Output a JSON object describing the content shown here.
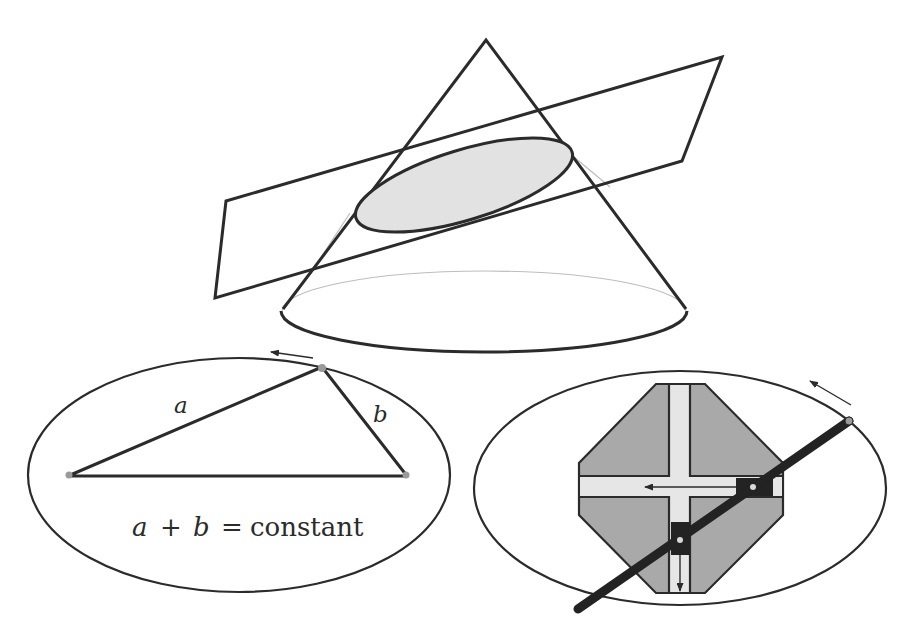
{
  "figure": {
    "colors": {
      "stroke": "#2b2b2b",
      "faint_line": "#b8b8b8",
      "section_fill": "#e2e2e2",
      "trammel_body": "#a9a9a9",
      "slot_fill": "#e6e6e6",
      "rod": "#232323",
      "focus_dot": "#9a9a9a"
    }
  },
  "cone_panel": {
    "apex": [
      486,
      40
    ],
    "base_ellipse": {
      "cx": 484,
      "cy": 311,
      "rx": 204,
      "ry": 41
    },
    "cutting_plane": [
      [
        226,
        201
      ],
      [
        722,
        57
      ],
      [
        682,
        161
      ],
      [
        215,
        298
      ]
    ],
    "section_ellipse": {
      "cx": 464,
      "cy": 185,
      "rx": 113,
      "ry": 35,
      "rotation": -17
    }
  },
  "string_construction": {
    "ellipse": {
      "cx": 239,
      "cy": 475,
      "rx": 211,
      "ry": 117
    },
    "focus_left": [
      68,
      476
    ],
    "focus_right": [
      407,
      476
    ],
    "point_on_curve": [
      322,
      367
    ],
    "label_a": "a",
    "label_b": "b",
    "equation": {
      "a": "a",
      "plus": "+",
      "b": "b",
      "equals": "=",
      "rhs": "constant"
    }
  },
  "trammel": {
    "ellipse": {
      "cx": 680,
      "cy": 488,
      "rx": 206,
      "ry": 117
    },
    "rod_start": [
      578,
      609
    ],
    "rod_end": [
      849,
      421
    ],
    "slider_horizontal_pivot": [
      753,
      488
    ],
    "slider_vertical_pivot": [
      680,
      540
    ]
  }
}
